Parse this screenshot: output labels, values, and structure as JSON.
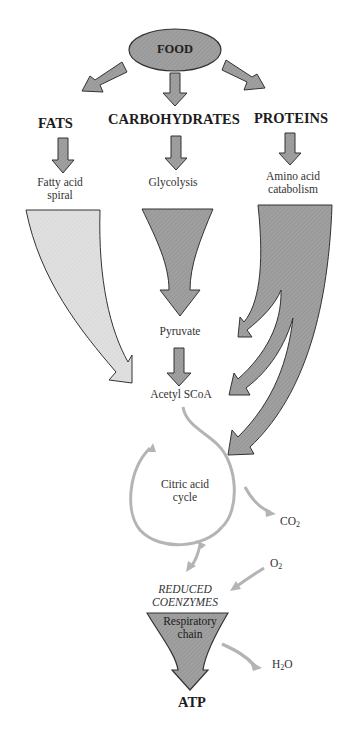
{
  "diagram": {
    "root": "FOOD",
    "categories": {
      "fats": "FATS",
      "carbohydrates": "CARBOHYDRATES",
      "proteins": "PROTEINS"
    },
    "processes": {
      "fatty_acid_line1": "Fatty acid",
      "fatty_acid_line2": "spiral",
      "glycolysis": "Glycolysis",
      "amino_line1": "Amino acid",
      "amino_line2": "catabolism"
    },
    "intermediates": {
      "pyruvate": "Pyruvate",
      "acetyl": "Acetyl SCoA",
      "citric_line1": "Citric acid",
      "citric_line2": "cycle"
    },
    "products": {
      "co2_base": "CO",
      "co2_sub": "2",
      "o2_base": "O",
      "o2_sub": "2",
      "h2o_pre": "H",
      "h2o_sub": "2",
      "h2o_post": "O"
    },
    "coenzymes_line1": "REDUCED",
    "coenzymes_line2": "COENZYMES",
    "resp_line1": "Respiratory",
    "resp_line2": "chain",
    "final": "ATP"
  },
  "colors": {
    "dark_fill": "#9a9a9a",
    "light_fill": "#dcdcdc",
    "flow_line": "#b4b4b4",
    "outline": "#3a3a3a"
  }
}
